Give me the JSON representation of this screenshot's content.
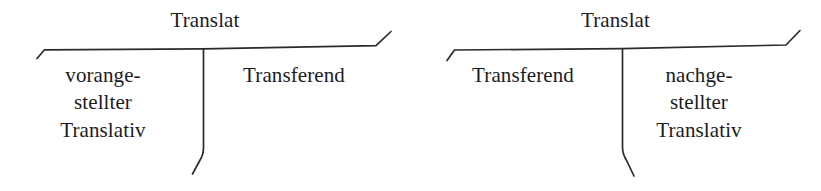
{
  "page": {
    "background_color": "#ffffff",
    "ink_color": "#1b1b1f"
  },
  "diagrams": [
    {
      "id": "preposed",
      "root": {
        "label": "Translat"
      },
      "branches": [
        {
          "id": "translativ-preposed",
          "label": "vorange-\nstellter\nTranslativ"
        },
        {
          "id": "transferend",
          "label": "Transferend"
        }
      ]
    },
    {
      "id": "postposed",
      "root": {
        "label": "Translat"
      },
      "branches": [
        {
          "id": "transferend",
          "label": "Transferend"
        },
        {
          "id": "translativ-postposed",
          "label": "nachge-\nstellter\nTranslativ"
        }
      ]
    }
  ]
}
